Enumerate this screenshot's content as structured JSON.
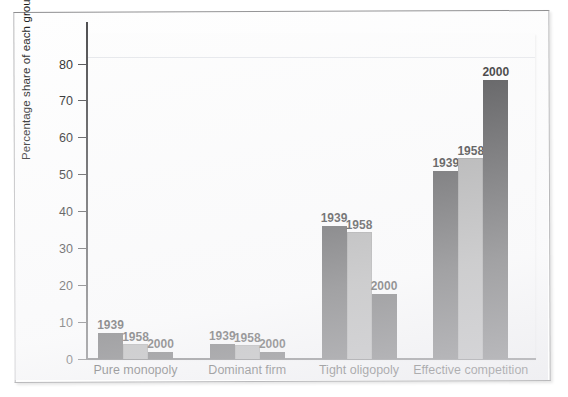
{
  "figure": {
    "frame_style": "scanned-textbook-page",
    "background_color": "#ffffff"
  },
  "chart_data": {
    "type": "bar",
    "title": "",
    "subtitle": "",
    "xlabel": "",
    "ylabel": "Percentage share of each group",
    "ylim": [
      0,
      88
    ],
    "ytick_labels": [
      "0",
      "10",
      "20",
      "30",
      "40",
      "50",
      "60",
      "70",
      "80"
    ],
    "yticks": [
      0,
      10,
      20,
      30,
      40,
      50,
      60,
      70,
      80
    ],
    "grid": false,
    "legend_position": "none",
    "bar_value_labels": true,
    "categories": [
      "Pure monopoly",
      "Dominant firm",
      "Tight oligopoly",
      "Effective competition"
    ],
    "series": [
      {
        "name": "1939",
        "color": "#3b3b3d",
        "values": [
          7,
          4.2,
          36,
          51
        ]
      },
      {
        "name": "1958",
        "color": "#9c9c9c",
        "values": [
          4,
          3.7,
          34.5,
          54.5
        ]
      },
      {
        "name": "2000",
        "color": "#3b3b3d",
        "values": [
          2,
          2,
          17.5,
          75.5
        ]
      }
    ]
  },
  "axis": {
    "y_title": "Percentage share of each group"
  },
  "colors": {
    "dark_bar": "#3b3b3d",
    "light_bar": "#9c9c9c",
    "axis": "#4a4a4c",
    "text": "#151515",
    "page_border": "#b9b9bb"
  }
}
